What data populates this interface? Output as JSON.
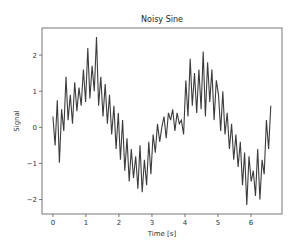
{
  "chart_data": {
    "type": "line",
    "title": "Noisy Sine",
    "xlabel": "Time [s]",
    "ylabel": "Signal",
    "xlim": [
      -0.33,
      6.94
    ],
    "ylim": [
      -2.4,
      2.75
    ],
    "xticks": [
      0,
      1,
      2,
      3,
      4,
      5,
      6
    ],
    "yticks": [
      -2,
      -1,
      0,
      1,
      2
    ],
    "grid": false,
    "legend": null,
    "series": [
      {
        "name": "signal",
        "color": "#000000",
        "x": [
          0.0,
          0.066,
          0.132,
          0.198,
          0.264,
          0.33,
          0.396,
          0.462,
          0.528,
          0.594,
          0.66,
          0.726,
          0.792,
          0.858,
          0.924,
          0.99,
          1.056,
          1.122,
          1.188,
          1.254,
          1.32,
          1.386,
          1.452,
          1.518,
          1.584,
          1.65,
          1.716,
          1.782,
          1.848,
          1.914,
          1.98,
          2.046,
          2.112,
          2.178,
          2.244,
          2.31,
          2.376,
          2.442,
          2.508,
          2.574,
          2.64,
          2.706,
          2.772,
          2.838,
          2.904,
          2.97,
          3.036,
          3.102,
          3.168,
          3.234,
          3.3,
          3.366,
          3.432,
          3.498,
          3.564,
          3.63,
          3.696,
          3.762,
          3.828,
          3.894,
          3.96,
          4.026,
          4.092,
          4.158,
          4.224,
          4.29,
          4.356,
          4.422,
          4.488,
          4.554,
          4.62,
          4.686,
          4.752,
          4.818,
          4.884,
          4.95,
          5.016,
          5.082,
          5.148,
          5.214,
          5.28,
          5.346,
          5.412,
          5.478,
          5.544,
          5.61,
          5.676,
          5.742,
          5.808,
          5.874,
          5.94,
          6.006,
          6.072,
          6.138,
          6.204,
          6.27,
          6.336,
          6.402,
          6.468,
          6.534,
          6.6
        ],
        "y": [
          0.3,
          -0.5,
          0.75,
          -0.98,
          0.5,
          -0.1,
          1.4,
          0.2,
          0.9,
          0.1,
          1.25,
          0.45,
          1.1,
          0.6,
          1.6,
          0.7,
          2.2,
          0.8,
          1.7,
          1.0,
          2.5,
          0.6,
          1.4,
          0.3,
          1.2,
          0.1,
          0.9,
          -0.2,
          0.6,
          -0.6,
          0.4,
          -0.9,
          0.2,
          -1.2,
          -0.3,
          -1.5,
          -0.6,
          -1.4,
          -0.8,
          -1.7,
          -0.5,
          -1.8,
          -0.9,
          -1.6,
          -0.4,
          -1.3,
          -0.2,
          -0.7,
          0.1,
          -0.4,
          0.0,
          0.3,
          -0.3,
          0.4,
          0.2,
          0.5,
          -0.1,
          0.4,
          0.1,
          0.2,
          -0.2,
          1.3,
          0.3,
          1.9,
          0.6,
          1.5,
          0.4,
          1.6,
          0.5,
          2.1,
          0.3,
          1.8,
          0.7,
          1.6,
          0.2,
          1.3,
          0.9,
          -0.1,
          1.0,
          -0.2,
          0.4,
          -0.6,
          0.1,
          -0.9,
          -0.2,
          -1.1,
          -0.4,
          -1.6,
          -0.7,
          -2.15,
          -0.8,
          -1.5,
          -1.2,
          -1.9,
          -0.6,
          -2.0,
          -0.9,
          -1.3,
          0.2,
          -0.6,
          0.6
        ]
      }
    ]
  }
}
